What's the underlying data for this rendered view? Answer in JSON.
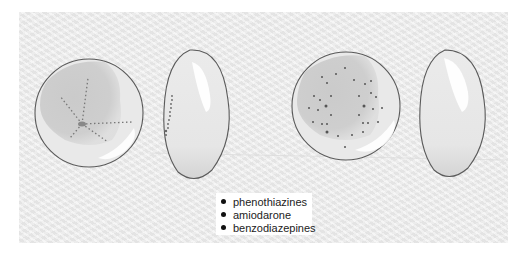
{
  "figure": {
    "panels": [
      {
        "id": "left-pair",
        "eye_front": "cornea-front-view-verticillata",
        "eye_side": "cornea-side-view-verticillata",
        "pattern": "whorl-like radiating dotted lines"
      },
      {
        "id": "right-pair",
        "eye_front": "cornea-front-view-scattered-deposits",
        "eye_side": "cornea-side-view-clear",
        "pattern": "scattered dot deposits"
      }
    ],
    "legend": {
      "items": [
        {
          "label": "phenothiazines"
        },
        {
          "label": "amiodarone"
        },
        {
          "label": "benzodiazepines"
        }
      ]
    },
    "colors": {
      "panel_bg": "#ececec",
      "outline": "#555555",
      "shading": "#cfcfcf",
      "deposit": "#444444"
    }
  }
}
